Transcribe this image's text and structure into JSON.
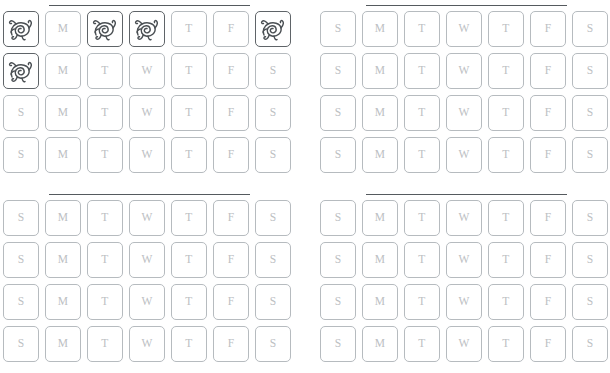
{
  "page": {
    "background_color": "#ffffff",
    "width": 610,
    "height": 373
  },
  "style": {
    "cell_border_color": "#b6bbbf",
    "cell_border_color_marked": "#5f6468",
    "day_letter_color": "#bcc0c3",
    "rule_color": "#555a5e",
    "scribble_color": "#4a4f53"
  },
  "day_labels": [
    "S",
    "M",
    "T",
    "W",
    "T",
    "F",
    "S"
  ],
  "mark_icon_name": "scribble-doodle-icon",
  "panels": [
    {
      "name": "top-left",
      "position": {
        "left": 0,
        "top": 0
      },
      "rule": {
        "visible": true
      },
      "rows": [
        {
          "cells": [
            {
              "label": "S",
              "marked": true
            },
            {
              "label": "M",
              "marked": false
            },
            {
              "label": "T",
              "marked": true
            },
            {
              "label": "W",
              "marked": true
            },
            {
              "label": "T",
              "marked": false
            },
            {
              "label": "F",
              "marked": false
            },
            {
              "label": "S",
              "marked": true
            }
          ]
        },
        {
          "cells": [
            {
              "label": "S",
              "marked": true
            },
            {
              "label": "M",
              "marked": false
            },
            {
              "label": "T",
              "marked": false
            },
            {
              "label": "W",
              "marked": false
            },
            {
              "label": "T",
              "marked": false
            },
            {
              "label": "F",
              "marked": false
            },
            {
              "label": "S",
              "marked": false
            }
          ]
        },
        {
          "cells": [
            {
              "label": "S",
              "marked": false
            },
            {
              "label": "M",
              "marked": false
            },
            {
              "label": "T",
              "marked": false
            },
            {
              "label": "W",
              "marked": false
            },
            {
              "label": "T",
              "marked": false
            },
            {
              "label": "F",
              "marked": false
            },
            {
              "label": "S",
              "marked": false
            }
          ]
        },
        {
          "cells": [
            {
              "label": "S",
              "marked": false
            },
            {
              "label": "M",
              "marked": false
            },
            {
              "label": "T",
              "marked": false
            },
            {
              "label": "W",
              "marked": false
            },
            {
              "label": "T",
              "marked": false
            },
            {
              "label": "F",
              "marked": false
            },
            {
              "label": "S",
              "marked": false
            }
          ]
        }
      ]
    },
    {
      "name": "top-right",
      "position": {
        "left": 317,
        "top": 0
      },
      "rule": {
        "visible": true
      },
      "rows": [
        {
          "cells": [
            {
              "label": "S",
              "marked": false
            },
            {
              "label": "M",
              "marked": false
            },
            {
              "label": "T",
              "marked": false
            },
            {
              "label": "W",
              "marked": false
            },
            {
              "label": "T",
              "marked": false
            },
            {
              "label": "F",
              "marked": false
            },
            {
              "label": "S",
              "marked": false
            }
          ]
        },
        {
          "cells": [
            {
              "label": "S",
              "marked": false
            },
            {
              "label": "M",
              "marked": false
            },
            {
              "label": "T",
              "marked": false
            },
            {
              "label": "W",
              "marked": false
            },
            {
              "label": "T",
              "marked": false
            },
            {
              "label": "F",
              "marked": false
            },
            {
              "label": "S",
              "marked": false
            }
          ]
        },
        {
          "cells": [
            {
              "label": "S",
              "marked": false
            },
            {
              "label": "M",
              "marked": false
            },
            {
              "label": "T",
              "marked": false
            },
            {
              "label": "W",
              "marked": false
            },
            {
              "label": "T",
              "marked": false
            },
            {
              "label": "F",
              "marked": false
            },
            {
              "label": "S",
              "marked": false
            }
          ]
        },
        {
          "cells": [
            {
              "label": "S",
              "marked": false
            },
            {
              "label": "M",
              "marked": false
            },
            {
              "label": "T",
              "marked": false
            },
            {
              "label": "W",
              "marked": false
            },
            {
              "label": "T",
              "marked": false
            },
            {
              "label": "F",
              "marked": false
            },
            {
              "label": "S",
              "marked": false
            }
          ]
        }
      ]
    },
    {
      "name": "bottom-left",
      "position": {
        "left": 0,
        "top": 189
      },
      "rule": {
        "visible": true
      },
      "rows": [
        {
          "cells": [
            {
              "label": "S",
              "marked": false
            },
            {
              "label": "M",
              "marked": false
            },
            {
              "label": "T",
              "marked": false
            },
            {
              "label": "W",
              "marked": false
            },
            {
              "label": "T",
              "marked": false
            },
            {
              "label": "F",
              "marked": false
            },
            {
              "label": "S",
              "marked": false
            }
          ]
        },
        {
          "cells": [
            {
              "label": "S",
              "marked": false
            },
            {
              "label": "M",
              "marked": false
            },
            {
              "label": "T",
              "marked": false
            },
            {
              "label": "W",
              "marked": false
            },
            {
              "label": "T",
              "marked": false
            },
            {
              "label": "F",
              "marked": false
            },
            {
              "label": "S",
              "marked": false
            }
          ]
        },
        {
          "cells": [
            {
              "label": "S",
              "marked": false
            },
            {
              "label": "M",
              "marked": false
            },
            {
              "label": "T",
              "marked": false
            },
            {
              "label": "W",
              "marked": false
            },
            {
              "label": "T",
              "marked": false
            },
            {
              "label": "F",
              "marked": false
            },
            {
              "label": "S",
              "marked": false
            }
          ]
        },
        {
          "cells": [
            {
              "label": "S",
              "marked": false
            },
            {
              "label": "M",
              "marked": false
            },
            {
              "label": "T",
              "marked": false
            },
            {
              "label": "W",
              "marked": false
            },
            {
              "label": "T",
              "marked": false
            },
            {
              "label": "F",
              "marked": false
            },
            {
              "label": "S",
              "marked": false
            }
          ]
        }
      ]
    },
    {
      "name": "bottom-right",
      "position": {
        "left": 317,
        "top": 189
      },
      "rule": {
        "visible": true
      },
      "rows": [
        {
          "cells": [
            {
              "label": "S",
              "marked": false
            },
            {
              "label": "M",
              "marked": false
            },
            {
              "label": "T",
              "marked": false
            },
            {
              "label": "W",
              "marked": false
            },
            {
              "label": "T",
              "marked": false
            },
            {
              "label": "F",
              "marked": false
            },
            {
              "label": "S",
              "marked": false
            }
          ]
        },
        {
          "cells": [
            {
              "label": "S",
              "marked": false
            },
            {
              "label": "M",
              "marked": false
            },
            {
              "label": "T",
              "marked": false
            },
            {
              "label": "W",
              "marked": false
            },
            {
              "label": "T",
              "marked": false
            },
            {
              "label": "F",
              "marked": false
            },
            {
              "label": "S",
              "marked": false
            }
          ]
        },
        {
          "cells": [
            {
              "label": "S",
              "marked": false
            },
            {
              "label": "M",
              "marked": false
            },
            {
              "label": "T",
              "marked": false
            },
            {
              "label": "W",
              "marked": false
            },
            {
              "label": "T",
              "marked": false
            },
            {
              "label": "F",
              "marked": false
            },
            {
              "label": "S",
              "marked": false
            }
          ]
        },
        {
          "cells": [
            {
              "label": "S",
              "marked": false
            },
            {
              "label": "M",
              "marked": false
            },
            {
              "label": "T",
              "marked": false
            },
            {
              "label": "W",
              "marked": false
            },
            {
              "label": "T",
              "marked": false
            },
            {
              "label": "F",
              "marked": false
            },
            {
              "label": "S",
              "marked": false
            }
          ]
        }
      ]
    }
  ]
}
